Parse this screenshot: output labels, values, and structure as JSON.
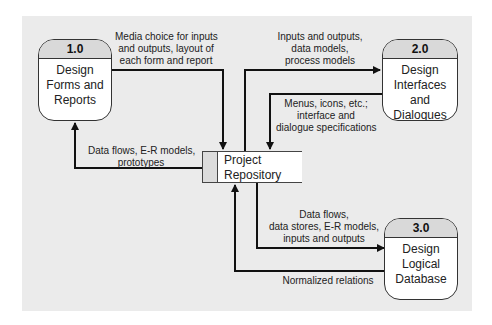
{
  "processes": [
    {
      "id": "1.0",
      "name_lines": [
        "Design",
        "Forms and",
        "Reports"
      ]
    },
    {
      "id": "2.0",
      "name_lines": [
        "Design",
        "Interfaces and",
        "Dialogues"
      ]
    },
    {
      "id": "3.0",
      "name_lines": [
        "Design",
        "Logical",
        "Database"
      ]
    }
  ],
  "data_store": {
    "name_lines": [
      "Project",
      "Repository"
    ]
  },
  "flows": [
    {
      "from": "1.0",
      "to": "Project Repository",
      "label_lines": [
        "Media choice for inputs",
        "and outputs, layout of",
        "each form and report"
      ]
    },
    {
      "from": "Project Repository",
      "to": "1.0",
      "label_lines": [
        "Data flows, E-R models,",
        "prototypes"
      ]
    },
    {
      "from": "Project Repository",
      "to": "2.0",
      "label_lines": [
        "Inputs and outputs,",
        "data models,",
        "process models"
      ]
    },
    {
      "from": "2.0",
      "to": "Project Repository",
      "label_lines": [
        "Menus, icons, etc.;",
        "interface and",
        "dialogue specifications"
      ]
    },
    {
      "from": "Project Repository",
      "to": "3.0",
      "label_lines": [
        "Data flows,",
        "data stores, E-R models,",
        "inputs and outputs"
      ]
    },
    {
      "from": "3.0",
      "to": "Project Repository",
      "label_lines": [
        "Normalized relations"
      ]
    }
  ]
}
